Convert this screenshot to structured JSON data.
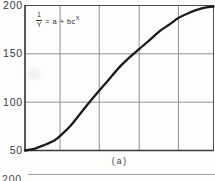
{
  "figure": {
    "caption": "(a)",
    "equation": {
      "numerator": "1",
      "denominator": "Y",
      "rhs_prefix": "= a + bc",
      "exponent": "X"
    },
    "next_panel_partial_label": "200"
  },
  "chart_data": {
    "type": "line",
    "title": "",
    "subtitle": "",
    "annotation_equation": "1/Y = a + bc^X",
    "caption": "(a)",
    "xlabel": "",
    "ylabel": "",
    "ylim": [
      50,
      200
    ],
    "yticks": [
      200,
      150,
      100,
      50
    ],
    "xticks_visible": false,
    "grid": true,
    "legend": "none",
    "grid_x_fractions": [
      0.186,
      0.394,
      0.606,
      0.814
    ],
    "grid_y_values": [
      150,
      100
    ],
    "series": [
      {
        "name": "sigmoid-growth-curve",
        "x_fraction": [
          0,
          0.053,
          0.106,
          0.16,
          0.197,
          0.239,
          0.293,
          0.346,
          0.399,
          0.452,
          0.505,
          0.559,
          0.612,
          0.665,
          0.718,
          0.771,
          0.814,
          0.867,
          0.92,
          0.963,
          1.0
        ],
        "values": [
          50,
          52,
          56,
          61,
          67,
          75,
          88,
          101,
          113,
          125,
          137,
          147,
          156,
          165,
          174,
          181,
          187,
          192,
          196,
          198,
          199
        ]
      }
    ],
    "colors": {
      "background": "#fdfdfc",
      "curve": "#1b1b1b",
      "grid": "#909090",
      "frame": "#4d4d4d",
      "axis": "#3c3c3c",
      "text": "#3a3a3a",
      "partial_rule": "#a6a6a6"
    }
  }
}
